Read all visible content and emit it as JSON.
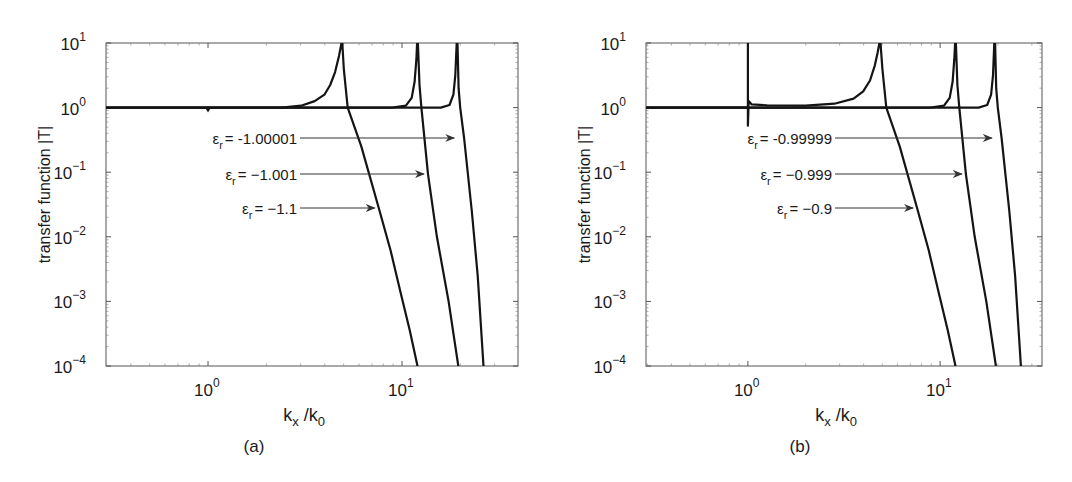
{
  "chart_data": [
    {
      "type": "line",
      "panel": "(a)",
      "caption": "(a)",
      "xlabel": "k_x /k_0",
      "ylabel": "transfer function |T|",
      "xscale": "log",
      "yscale": "log",
      "xlim": [
        0.3,
        40
      ],
      "ylim": [
        0.0001,
        10
      ],
      "xticks": [
        "10^0",
        "10^1"
      ],
      "yticks": [
        "10^1",
        "10^0",
        "10^-1",
        "10^-2",
        "10^-3",
        "10^-4"
      ],
      "grid": false,
      "legend": "none (inline arrow annotations)",
      "annotations": [
        {
          "text_prefix": "ε",
          "subscript": "r",
          "text": "= -1.00001",
          "arrow_to": [
            19.5,
            0.34
          ]
        },
        {
          "text_prefix": "ε",
          "subscript": "r",
          "text": "= −1.001",
          "arrow_to": [
            13.6,
            0.093
          ]
        },
        {
          "text_prefix": "ε",
          "subscript": "r",
          "text": "= −1.1",
          "arrow_to": [
            7.5,
            0.028
          ]
        }
      ],
      "series": [
        {
          "name": "εr = -1.1",
          "log_points": [
            [
              -0.53,
              0
            ],
            [
              0.0,
              0
            ],
            [
              0.38,
              0.0
            ],
            [
              0.48,
              0.03
            ],
            [
              0.55,
              0.1
            ],
            [
              0.6,
              0.2
            ],
            [
              0.63,
              0.35
            ],
            [
              0.655,
              0.55
            ],
            [
              0.675,
              0.8
            ],
            [
              0.688,
              1.0
            ],
            [
              0.692,
              1.0
            ],
            [
              0.7,
              0.6
            ],
            [
              0.72,
              0.0
            ],
            [
              0.79,
              -0.6
            ],
            [
              0.88,
              -1.55
            ],
            [
              0.94,
              -2.2
            ],
            [
              0.99,
              -2.83
            ],
            [
              1.04,
              -3.45
            ],
            [
              1.08,
              -4.0
            ]
          ],
          "dip_at_k1": true
        },
        {
          "name": "εr = -1.001",
          "log_points": [
            [
              -0.53,
              0
            ],
            [
              0.95,
              0
            ],
            [
              1.02,
              0.03
            ],
            [
              1.05,
              0.15
            ],
            [
              1.065,
              0.4
            ],
            [
              1.074,
              0.75
            ],
            [
              1.078,
              1.0
            ],
            [
              1.082,
              1.0
            ],
            [
              1.09,
              0.35
            ],
            [
              1.1,
              0.0
            ],
            [
              1.134,
              -1.03
            ],
            [
              1.18,
              -2.0
            ],
            [
              1.24,
              -3.0
            ],
            [
              1.29,
              -4.0
            ]
          ]
        },
        {
          "name": "εr = -1.00001",
          "log_points": [
            [
              -0.53,
              0
            ],
            [
              1.2,
              0
            ],
            [
              1.245,
              0.04
            ],
            [
              1.265,
              0.2
            ],
            [
              1.275,
              0.5
            ],
            [
              1.282,
              1.0
            ],
            [
              1.286,
              1.0
            ],
            [
              1.292,
              0.3
            ],
            [
              1.3,
              0.0
            ],
            [
              1.32,
              -0.47
            ],
            [
              1.36,
              -1.6
            ],
            [
              1.39,
              -2.6
            ],
            [
              1.42,
              -4.0
            ]
          ]
        }
      ]
    },
    {
      "type": "line",
      "panel": "(b)",
      "caption": "(b)",
      "xlabel": "k_x /k_0",
      "ylabel": "transfer function |T|",
      "xscale": "log",
      "yscale": "log",
      "xlim": [
        0.3,
        34
      ],
      "ylim": [
        0.0001,
        10
      ],
      "xticks": [
        "10^0",
        "10^1"
      ],
      "yticks": [
        "10^1",
        "10^0",
        "10^-1",
        "10^-2",
        "10^-3",
        "10^-4"
      ],
      "grid": false,
      "legend": "none (inline arrow annotations)",
      "annotations": [
        {
          "text_prefix": "ε",
          "subscript": "r",
          "text": "= -0.99999",
          "arrow_to": [
            19.5,
            0.34
          ]
        },
        {
          "text_prefix": "ε",
          "subscript": "r",
          "text": "= −0.999",
          "arrow_to": [
            13.6,
            0.093
          ]
        },
        {
          "text_prefix": "ε",
          "subscript": "r",
          "text": "= −0.9",
          "arrow_to": [
            7.5,
            0.028
          ]
        }
      ],
      "series": [
        {
          "name": "εr = -0.9",
          "log_points": [
            [
              -0.53,
              0
            ],
            [
              0.0,
              0
            ],
            [
              0.0,
              1.0
            ],
            [
              0.0,
              -0.28
            ],
            [
              0.004,
              0.1
            ],
            [
              0.02,
              0.05
            ],
            [
              0.1,
              0.035
            ],
            [
              0.3,
              0.03
            ],
            [
              0.45,
              0.06
            ],
            [
              0.55,
              0.14
            ],
            [
              0.6,
              0.25
            ],
            [
              0.635,
              0.42
            ],
            [
              0.66,
              0.65
            ],
            [
              0.675,
              0.85
            ],
            [
              0.684,
              1.0
            ],
            [
              0.69,
              1.0
            ],
            [
              0.7,
              0.6
            ],
            [
              0.72,
              0.0
            ],
            [
              0.79,
              -0.6
            ],
            [
              0.88,
              -1.55
            ],
            [
              0.94,
              -2.2
            ],
            [
              0.99,
              -2.83
            ],
            [
              1.04,
              -3.45
            ],
            [
              1.08,
              -4.0
            ]
          ]
        },
        {
          "name": "εr = -0.999",
          "log_points": [
            [
              -0.53,
              0
            ],
            [
              0.95,
              0
            ],
            [
              1.02,
              0.03
            ],
            [
              1.05,
              0.15
            ],
            [
              1.065,
              0.4
            ],
            [
              1.074,
              0.75
            ],
            [
              1.078,
              1.0
            ],
            [
              1.082,
              1.0
            ],
            [
              1.09,
              0.35
            ],
            [
              1.1,
              0.0
            ],
            [
              1.134,
              -1.03
            ],
            [
              1.18,
              -2.0
            ],
            [
              1.24,
              -3.0
            ],
            [
              1.29,
              -4.0
            ]
          ]
        },
        {
          "name": "εr = -0.99999",
          "log_points": [
            [
              -0.53,
              0
            ],
            [
              1.2,
              0
            ],
            [
              1.245,
              0.04
            ],
            [
              1.265,
              0.2
            ],
            [
              1.275,
              0.5
            ],
            [
              1.282,
              1.0
            ],
            [
              1.286,
              1.0
            ],
            [
              1.292,
              0.3
            ],
            [
              1.3,
              0.0
            ],
            [
              1.32,
              -0.47
            ],
            [
              1.36,
              -1.6
            ],
            [
              1.39,
              -2.6
            ],
            [
              1.42,
              -4.0
            ]
          ]
        }
      ]
    }
  ],
  "panels": [
    {
      "caption": "(a)",
      "ylabel": "transfer function |T|",
      "xlabel_main": "k",
      "xlabel_sub1": "x",
      "xlabel_sep": " /k",
      "xlabel_sub2": "0",
      "labels": [
        {
          "eps": "ε",
          "sub": "r",
          "val": "= -1.00001"
        },
        {
          "eps": "ε",
          "sub": "r",
          "val": "= −1.001"
        },
        {
          "eps": "ε",
          "sub": "r",
          "val": "= −1.1"
        }
      ]
    },
    {
      "caption": "(b)",
      "ylabel": "transfer function |T|",
      "xlabel_main": "k",
      "xlabel_sub1": "x",
      "xlabel_sep": " /k",
      "xlabel_sub2": "0",
      "labels": [
        {
          "eps": "ε",
          "sub": "r",
          "val": "= -0.99999"
        },
        {
          "eps": "ε",
          "sub": "r",
          "val": "= −0.999"
        },
        {
          "eps": "ε",
          "sub": "r",
          "val": "= −0.9"
        }
      ]
    }
  ],
  "tick_labels": {
    "y": [
      {
        "base": "10",
        "exp": "1"
      },
      {
        "base": "10",
        "exp": "0"
      },
      {
        "base": "10",
        "exp": "−1"
      },
      {
        "base": "10",
        "exp": "−2"
      },
      {
        "base": "10",
        "exp": "−3"
      },
      {
        "base": "10",
        "exp": "−4"
      }
    ],
    "x": [
      {
        "base": "10",
        "exp": "0"
      },
      {
        "base": "10",
        "exp": "1"
      }
    ]
  },
  "colors": {
    "line": "#141414",
    "axis": "#555555",
    "arrow": "#333333",
    "text": "#1a1a1a"
  }
}
